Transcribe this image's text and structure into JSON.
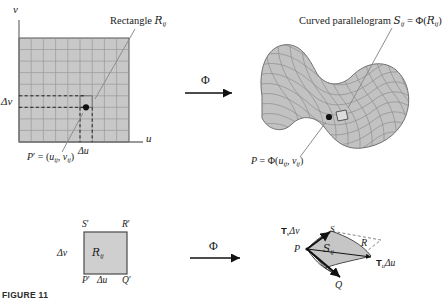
{
  "figure": {
    "title_top_left": "Rectangle",
    "title_top_left_symbol": "R",
    "title_top_left_sub": "ij",
    "title_top_right_prefix": "Curved parallelogram",
    "title_top_right_symbol": "S",
    "title_top_right_sub": "ij",
    "title_top_right_eq": "= Φ(",
    "title_top_right_symbol2": "R",
    "title_top_right_sub2": "ij",
    "title_top_right_close": ")",
    "caption": "FIGURE 11"
  },
  "top_left_panel": {
    "axis_v": "v",
    "axis_u": "u",
    "delta_v": "Δv",
    "delta_u": "Δu",
    "point_label_name": "P",
    "point_label_prime": "′",
    "point_label_eq": "= (",
    "point_label_u": "u",
    "point_label_usub": "ij",
    "point_label_comma": ",",
    "point_label_v": "v",
    "point_label_vsub": "ij",
    "point_label_close": ")",
    "grid_cols": 9,
    "grid_rows": 9,
    "fill_color": "#c8c8c8",
    "grid_color": "#9a9a9a",
    "border_color": "#555555"
  },
  "top_right_panel": {
    "point_label_name": "P",
    "point_label_eq": "= Φ(",
    "point_label_u": "u",
    "point_label_usub": "ij",
    "point_label_comma": ",",
    "point_label_v": "v",
    "point_label_vsub": "ij",
    "point_label_close": ")",
    "surface_fill": "#c2c2c2",
    "surface_mesh": "#8a8a8a"
  },
  "map_arrows": {
    "top_symbol": "Φ",
    "bottom_symbol": "Φ"
  },
  "bottom_left_panel": {
    "corner_S": "S",
    "corner_S_prime": "′",
    "corner_R": "R",
    "corner_R_prime": "′",
    "corner_P": "P",
    "corner_P_prime": "′",
    "corner_Q": "Q",
    "corner_Q_prime": "′",
    "delta_v": "Δv",
    "delta_u": "Δu",
    "region_symbol": "R",
    "region_sub": "ij",
    "fill_color": "#cfcfcf",
    "border_color": "#4a4a4a"
  },
  "bottom_right_panel": {
    "vec_v_bold": "T",
    "vec_v_sub": "v",
    "vec_v_delta": "Δv",
    "vec_u_bold": "T",
    "vec_u_sub": "u",
    "vec_u_delta": "Δu",
    "corner_P": "P",
    "corner_Q": "Q",
    "corner_S": "S",
    "corner_R": "R",
    "region_symbol": "S",
    "region_sub": "ij",
    "fill_color": "#c6c6c6",
    "dash_color": "#777777"
  }
}
